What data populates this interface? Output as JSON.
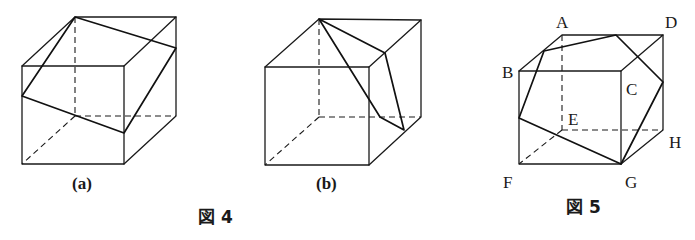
{
  "figure4": {
    "caption": "図 4",
    "subfigures": [
      {
        "id": "a",
        "label": "(a)",
        "section_shape": "quadrilateral"
      },
      {
        "id": "b",
        "label": "(b)",
        "section_shape": "quadrilateral"
      }
    ]
  },
  "figure5": {
    "caption": "図 5",
    "vertex_labels": {
      "A": "A",
      "B": "B",
      "C": "C",
      "D": "D",
      "E": "E",
      "F": "F",
      "G": "G",
      "H": "H"
    },
    "section_shape": "pentagon"
  }
}
